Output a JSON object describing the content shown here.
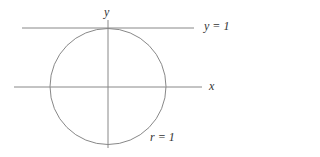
{
  "diagram": {
    "axis_labels": {
      "x": "x",
      "y": "y"
    },
    "line_label": "y = 1",
    "circle_label": "r = 1",
    "colors": {
      "stroke": "#888888",
      "text": "#333333"
    }
  }
}
